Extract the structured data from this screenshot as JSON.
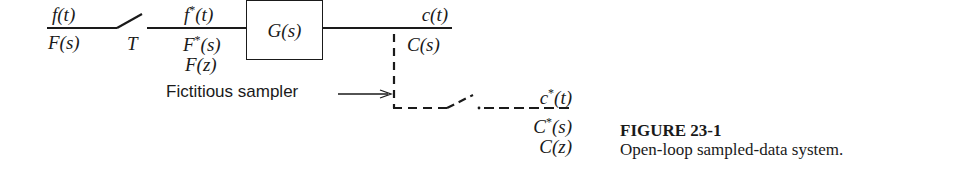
{
  "figure": {
    "number": "FIGURE 23-1",
    "caption": "Open-loop sampled-data system."
  },
  "input": {
    "time_signal": "f(t)",
    "laplace_signal": "F(s)"
  },
  "sampler": {
    "period_label": "T"
  },
  "sampled_input": {
    "time_fn": "f",
    "time_arg": "(t)",
    "laplace_fn": "F",
    "laplace_arg": "(s)",
    "z_signal": "F(z)",
    "star": "*"
  },
  "block": {
    "transfer_function": "G(s)"
  },
  "output": {
    "time_signal": "c(t)",
    "laplace_signal": "C(s)"
  },
  "fictitious_sampler": {
    "label": "Fictitious sampler"
  },
  "sampled_output": {
    "time_fn": "c",
    "time_arg": "(t)",
    "laplace_fn": "C",
    "laplace_arg": "(s)",
    "z_signal": "C(z)",
    "star": "*"
  },
  "colors": {
    "line": "#1a1a1a",
    "background": "#ffffff"
  }
}
